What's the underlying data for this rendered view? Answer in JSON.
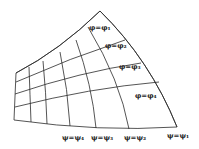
{
  "diagram": {
    "phi_labels": [
      {
        "text": "φ=φ₁",
        "x": 89,
        "y": 30
      },
      {
        "text": "φ=φ₂",
        "x": 105,
        "y": 48
      },
      {
        "text": "φ=φ₃",
        "x": 119,
        "y": 69
      },
      {
        "text": "φ=φ₄",
        "x": 135,
        "y": 98
      }
    ],
    "psi_labels": [
      {
        "text": "ψ=ψ₄",
        "x": 62,
        "y": 140
      },
      {
        "text": "ψ=ψ₃",
        "x": 91,
        "y": 140
      },
      {
        "text": "ψ=ψ₂",
        "x": 124,
        "y": 140
      },
      {
        "text": "ψ=ψ₁",
        "x": 167,
        "y": 138
      }
    ],
    "colors": {
      "line": "#2a2a2a",
      "background": "#ffffff"
    }
  }
}
